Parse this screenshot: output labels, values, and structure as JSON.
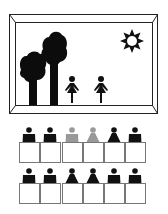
{
  "scene": {
    "description": "Classroom illustration: a picture frame showing trees, sun and two girls, above two rows of six student desks",
    "frame": {
      "outer": [
        9,
        14,
        158,
        114
      ],
      "inner": [
        15,
        22,
        153,
        106
      ],
      "stroke": "#222222"
    },
    "sun": {
      "cx": 132,
      "cy": 41,
      "icon": "sun-icon"
    },
    "trees": [
      {
        "name": "tree-left",
        "x": 32
      },
      {
        "name": "tree-right",
        "x": 55
      }
    ],
    "girls_in_picture": [
      {
        "cx": 72,
        "icon": "girl-icon"
      },
      {
        "cx": 101,
        "icon": "girl-icon"
      }
    ]
  },
  "desks": {
    "rows": [
      {
        "row": 1,
        "students": [
          {
            "type": "boy",
            "color": "#111111"
          },
          {
            "type": "boy",
            "color": "#111111"
          },
          {
            "type": "boy",
            "color": "#999999"
          },
          {
            "type": "girl",
            "color": "#999999"
          },
          {
            "type": "girl",
            "color": "#111111"
          },
          {
            "type": "boy",
            "color": "#111111"
          }
        ]
      },
      {
        "row": 2,
        "students": [
          {
            "type": "boy",
            "color": "#111111"
          },
          {
            "type": "boy",
            "color": "#111111"
          },
          {
            "type": "girl",
            "color": "#111111"
          },
          {
            "type": "girl",
            "color": "#111111"
          },
          {
            "type": "boy",
            "color": "#111111"
          },
          {
            "type": "boy",
            "color": "#111111"
          }
        ]
      }
    ],
    "desk_stroke": "#777777"
  }
}
